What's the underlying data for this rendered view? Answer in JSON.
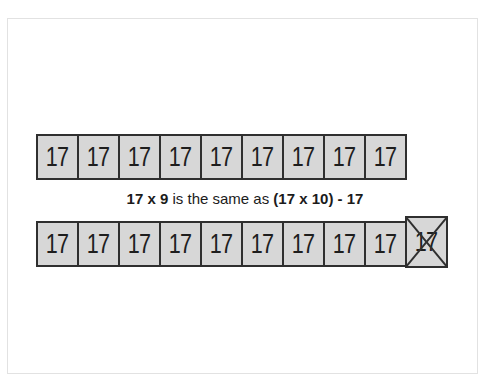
{
  "page": {
    "background": "#ffffff",
    "frame_border_color": "#e2e2e2"
  },
  "colors": {
    "box_fill": "#d7d7d7",
    "box_border": "#2f2f2f",
    "digit_color": "#1e1e1e",
    "equation_color": "#1b1b1b",
    "cross_color": "#2f2f2f"
  },
  "equation": {
    "lhs": "17 x 9",
    "middle": "is the same as",
    "rhs": "(17 x 10) - 17"
  },
  "top_row": {
    "values": [
      "17",
      "17",
      "17",
      "17",
      "17",
      "17",
      "17",
      "17",
      "17"
    ]
  },
  "bottom_row": {
    "values": [
      "17",
      "17",
      "17",
      "17",
      "17",
      "17",
      "17",
      "17",
      "17",
      "17"
    ],
    "crossed_index": 9
  },
  "icons": {
    "cross_out_icon": "X"
  }
}
